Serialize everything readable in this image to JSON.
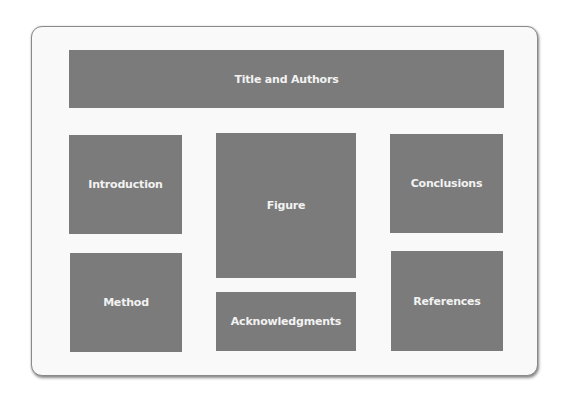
{
  "layout": {
    "title": "Title and Authors",
    "sections": {
      "introduction": "Introduction",
      "method": "Method",
      "figure": "Figure",
      "acknowledgments": "Acknowledgments",
      "conclusions": "Conclusions",
      "references": "References"
    }
  },
  "colors": {
    "box_fill": "#7b7b7b",
    "card_background": "#f9f9f9",
    "text": "#f2f2f2"
  }
}
